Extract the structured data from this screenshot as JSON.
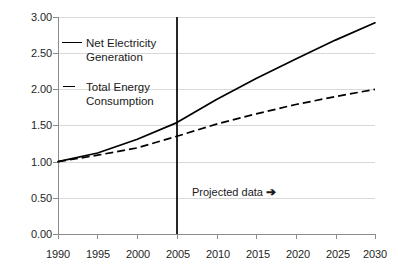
{
  "chart_data": {
    "type": "line",
    "title": "",
    "subtitle": "",
    "xlabel": "",
    "ylabel": "",
    "xlim": [
      1990,
      2030
    ],
    "ylim": [
      0.0,
      3.0
    ],
    "grid": true,
    "grid_axis": "y",
    "legend_position": "upper-left-inside",
    "x_ticks": [
      1990,
      1995,
      2000,
      2005,
      2010,
      2015,
      2020,
      2025,
      2030
    ],
    "x_tick_labels": [
      "1990",
      "1995",
      "2000",
      "2005",
      "2010",
      "2015",
      "2020",
      "2025",
      "2030"
    ],
    "y_ticks": [
      0.0,
      0.5,
      1.0,
      1.5,
      2.0,
      2.5,
      3.0
    ],
    "y_tick_labels": [
      "0.00",
      "0.50",
      "1.00",
      "1.50",
      "2.00",
      "2.50",
      "3.00"
    ],
    "x": [
      1990,
      1995,
      2000,
      2005,
      2010,
      2015,
      2020,
      2025,
      2030
    ],
    "series": [
      {
        "name": "Net Electricity Generation",
        "style": "solid",
        "color": "#000000",
        "values": [
          1.0,
          1.12,
          1.31,
          1.54,
          1.86,
          2.15,
          2.42,
          2.68,
          2.92
        ]
      },
      {
        "name": "Total Energy Consumption",
        "style": "dashed",
        "color": "#000000",
        "values": [
          1.0,
          1.09,
          1.19,
          1.35,
          1.52,
          1.66,
          1.79,
          1.9,
          2.0
        ]
      }
    ],
    "annotations": [
      {
        "name": "projected-data-marker",
        "text": "Projected data",
        "arrow_glyph": "➔",
        "x": 2005,
        "y": 0.72,
        "marker": "vertical-line-at-2005"
      }
    ],
    "vertical_divider": {
      "x": 2005,
      "label": "projection-start-line",
      "color": "#262626"
    }
  },
  "legend": {
    "items": [
      {
        "label_line1": "Net Electricity",
        "label_line2": "Generation",
        "style": "solid"
      },
      {
        "label_line1": "Total Energy",
        "label_line2": "Consumption",
        "style": "dashed"
      }
    ]
  }
}
